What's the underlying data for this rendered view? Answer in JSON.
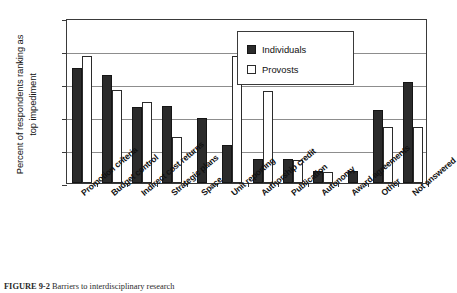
{
  "figure": {
    "caption_label": "FIGURE 9-2",
    "caption_text": "Barriers to interdisciplinary research"
  },
  "chart_data": {
    "type": "bar",
    "title": "",
    "xlabel": "",
    "ylabel": "Percent of respondents ranking as\ntop impediment",
    "ylim": [
      0.0,
      25.0
    ],
    "ytick_labels": [
      "0.0",
      "5.0",
      "10.0",
      "15.0",
      "20.0",
      "25.0"
    ],
    "ytick_values": [
      0.0,
      5.0,
      10.0,
      15.0,
      20.0,
      25.0
    ],
    "grid": true,
    "grid_axis": "y",
    "legend_position": "upper center",
    "categories": [
      "Promotion criteria",
      "Budget control",
      "Indirect cost returns",
      "Strategic plans",
      "Space",
      "Unit reporting",
      "Authorship credit",
      "Publication",
      "Autonomy",
      "Award agreements",
      "Other",
      "Not answered"
    ],
    "series": [
      {
        "name": "Individuals",
        "color": "#2b2b2b",
        "values": [
          17.4,
          16.3,
          11.5,
          11.7,
          9.8,
          5.8,
          3.7,
          3.7,
          1.8,
          1.8,
          11.0,
          15.3
        ]
      },
      {
        "name": "Provosts",
        "color": "#ffffff",
        "values": [
          19.3,
          14.1,
          12.2,
          7.0,
          0.0,
          19.2,
          13.9,
          3.5,
          1.6,
          0.0,
          8.5,
          8.5
        ]
      }
    ]
  }
}
